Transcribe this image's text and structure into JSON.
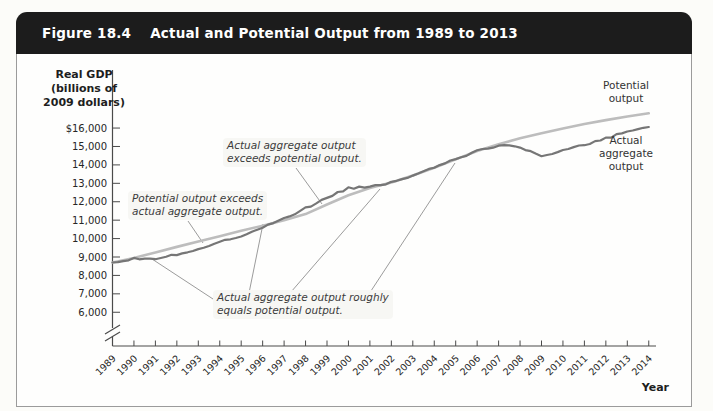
{
  "header": {
    "figure_label": "Figure 18.4",
    "title": "Actual and Potential Output from 1989 to 2013"
  },
  "chart": {
    "y_axis_title": "Real GDP\n(billions of\n2009 dollars)",
    "x_axis_title": "Year",
    "series_labels": {
      "potential": "Potential\noutput",
      "actual": "Actual\naggregate\noutput"
    },
    "annotations": [
      {
        "id": "potential-exceeds",
        "text": "Potential output exceeds\nactual aggregate output."
      },
      {
        "id": "actual-exceeds",
        "text": "Actual aggregate output\nexceeds potential output."
      },
      {
        "id": "roughly-equals",
        "text": "Actual aggregate output roughly\nequals potential output."
      }
    ]
  },
  "chart_data": {
    "type": "line",
    "title": "Actual and Potential Output from 1989 to 2013",
    "xlabel": "Year",
    "ylabel": "Real GDP (billions of 2009 dollars)",
    "grid": false,
    "axis_break_bottom": true,
    "ylim": [
      6000,
      17000
    ],
    "y_tick_labels": [
      "$16,000",
      "15,000",
      "14,000",
      "13,000",
      "12,000",
      "11,000",
      "10,000",
      "9,000",
      "8,000",
      "7,000",
      "6,000"
    ],
    "y_tick_values": [
      16000,
      15000,
      14000,
      13000,
      12000,
      11000,
      10000,
      9000,
      8000,
      7000,
      6000
    ],
    "x": [
      1989,
      1990,
      1991,
      1992,
      1993,
      1994,
      1995,
      1996,
      1997,
      1998,
      1999,
      2000,
      2001,
      2002,
      2003,
      2004,
      2005,
      2006,
      2007,
      2008,
      2009,
      2010,
      2011,
      2012,
      2013,
      2014
    ],
    "series": [
      {
        "name": "Potential output",
        "color": "#bdbdbd",
        "values": [
          8700,
          8950,
          9250,
          9550,
          9840,
          10130,
          10420,
          10700,
          11000,
          11330,
          11850,
          12350,
          12750,
          13050,
          13420,
          13850,
          14300,
          14750,
          15120,
          15450,
          15720,
          15980,
          16220,
          16430,
          16630,
          16800
        ]
      },
      {
        "name": "Actual aggregate output",
        "color": "#767676",
        "values": [
          8700,
          8930,
          8880,
          9140,
          9440,
          9830,
          10140,
          10600,
          11090,
          11640,
          12230,
          12740,
          12830,
          13040,
          13400,
          13900,
          14340,
          14740,
          15040,
          14990,
          14440,
          14790,
          15090,
          15440,
          15790,
          16060
        ]
      }
    ]
  }
}
